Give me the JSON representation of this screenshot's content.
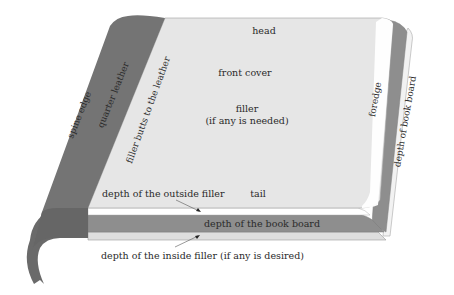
{
  "diagram": {
    "labels": {
      "head": "head",
      "front_cover": "front cover",
      "filler_line1": "filler",
      "filler_line2": "(if any is needed)",
      "tail": "tail",
      "foredge": "foredge",
      "spine_edge": "spine edge",
      "quarter_leather": "quarter leather",
      "filler_butts": "filler butts to the leather",
      "depth_book_board_right": "depth of book board",
      "depth_book_board_bottom": "depth of the book board",
      "depth_outside_filler": "depth of the outside filler",
      "depth_inside_filler": "depth of the inside filler (if any is desired)"
    },
    "colors": {
      "cover": "#e6e6e6",
      "leather": "#747474",
      "leather_dark": "#666666",
      "board": "#8e8e8e",
      "filler_white": "#ffffff",
      "inner_filler": "#dcdcdc",
      "outline": "#9a9a9a",
      "text": "#2a2a2a"
    }
  }
}
